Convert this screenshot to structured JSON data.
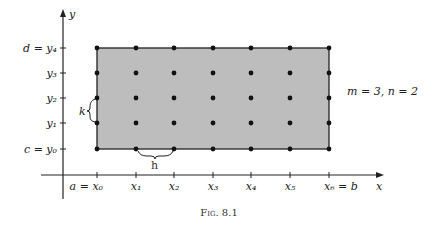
{
  "figure": {
    "caption": "Fig. 8.1",
    "annotation": "m = 3, n = 2",
    "colors": {
      "region_fill": "#bdbdbd",
      "line": "#222222"
    }
  },
  "axes": {
    "x_label": "x",
    "y_label": "y",
    "x_ticks": [
      "a = x₀",
      "x₁",
      "x₂",
      "x₃",
      "x₄",
      "x₅",
      "x₆ = b"
    ],
    "y_ticks": [
      "c = y₀",
      "y₁",
      "y₂",
      "y₃",
      "d = y₄"
    ]
  },
  "braces": {
    "h_label": "h",
    "k_label": "k"
  }
}
